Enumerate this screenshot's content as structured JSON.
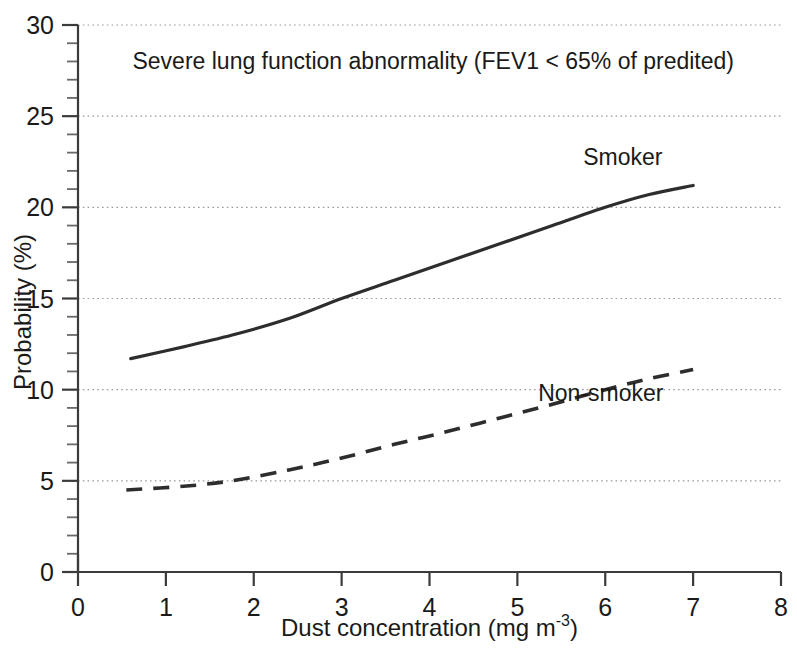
{
  "chart_data": {
    "type": "line",
    "title": "Severe lung function abnormality (FEV1 < 65% of predited)",
    "xlabel": "Dust concentration (mg m",
    "xlabel_sup": "-3",
    "xlabel_tail": ")",
    "xlabel_full": "Dust concentration (mg m-3)",
    "ylabel": "Probability (%)",
    "xlim": [
      0,
      8
    ],
    "ylim": [
      0,
      30
    ],
    "xticks": [
      0,
      1,
      2,
      3,
      4,
      5,
      6,
      7,
      8
    ],
    "xtick_labels": [
      "0",
      "1",
      "2",
      "3",
      "4",
      "5",
      "6",
      "7",
      "8"
    ],
    "yticks": [
      0,
      5,
      10,
      15,
      20,
      25,
      30
    ],
    "ytick_labels": [
      "0",
      "5",
      "10",
      "15",
      "20",
      "25",
      "30"
    ],
    "y_minor_tick_step": 1,
    "grid": "horizontal-dotted-at-major-y",
    "legend_position": "inline-annotations",
    "series": [
      {
        "name": "Smoker",
        "style": "solid",
        "color": "#2d2d2d",
        "label_x": 6.2,
        "label_y": 22.3,
        "x": [
          0.6,
          1.2,
          1.8,
          2.4,
          3.0,
          3.6,
          4.2,
          4.8,
          5.4,
          6.0,
          6.5,
          7.0
        ],
        "y": [
          11.7,
          12.35,
          13.05,
          13.9,
          15.0,
          16.0,
          17.0,
          18.0,
          19.0,
          20.0,
          20.7,
          21.2
        ]
      },
      {
        "name": "Non-smoker",
        "style": "dashed",
        "color": "#2d2d2d",
        "label_x": 5.95,
        "label_y": 9.4,
        "x": [
          0.55,
          1.2,
          1.75,
          2.4,
          3.0,
          3.6,
          4.2,
          4.8,
          5.4,
          6.0,
          6.5,
          7.0
        ],
        "y": [
          4.5,
          4.7,
          5.0,
          5.6,
          6.25,
          7.0,
          7.7,
          8.45,
          9.2,
          10.0,
          10.6,
          11.1
        ]
      }
    ],
    "annotations": [
      {
        "text": "Severe lung function abnormality (FEV1 < 65% of predited)",
        "x": 0.62,
        "y": 27.6
      }
    ]
  }
}
